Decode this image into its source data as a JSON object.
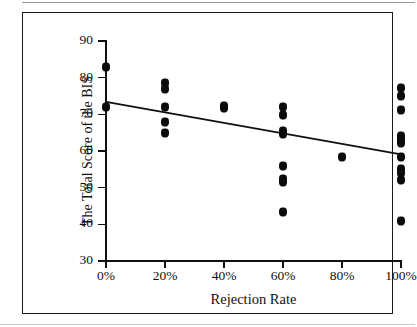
{
  "chart_data": {
    "type": "scatter",
    "title": "",
    "xlabel": "Rejection Rate",
    "ylabel": "The Total Score of the BIS",
    "xlim": [
      0,
      100
    ],
    "ylim": [
      30,
      90
    ],
    "grid": false,
    "legend": "none",
    "x_tick_labels": [
      "0%",
      "20%",
      "40%",
      "60%",
      "80%",
      "100%"
    ],
    "x_tick_values": [
      0,
      20,
      40,
      60,
      80,
      100
    ],
    "y_tick_labels": [
      "30",
      "40",
      "50",
      "60",
      "70",
      "80",
      "90"
    ],
    "y_tick_values": [
      30,
      40,
      50,
      60,
      70,
      80,
      90
    ],
    "points": [
      {
        "x": 0,
        "y": 83
      },
      {
        "x": 0,
        "y": 72
      },
      {
        "x": 20,
        "y": 78.5
      },
      {
        "x": 20,
        "y": 77
      },
      {
        "x": 20,
        "y": 72
      },
      {
        "x": 20,
        "y": 68
      },
      {
        "x": 20,
        "y": 65
      },
      {
        "x": 40,
        "y": 72.3
      },
      {
        "x": 40,
        "y": 71.6
      },
      {
        "x": 60,
        "y": 72
      },
      {
        "x": 60,
        "y": 69.7
      },
      {
        "x": 60,
        "y": 65.4
      },
      {
        "x": 60,
        "y": 64.6
      },
      {
        "x": 60,
        "y": 56
      },
      {
        "x": 60,
        "y": 52.5
      },
      {
        "x": 60,
        "y": 51.6
      },
      {
        "x": 60,
        "y": 43.5
      },
      {
        "x": 80,
        "y": 58.5
      },
      {
        "x": 100,
        "y": 77.2
      },
      {
        "x": 100,
        "y": 75
      },
      {
        "x": 100,
        "y": 71.2
      },
      {
        "x": 100,
        "y": 64.2
      },
      {
        "x": 100,
        "y": 63.2
      },
      {
        "x": 100,
        "y": 62.3
      },
      {
        "x": 100,
        "y": 58.4
      },
      {
        "x": 100,
        "y": 55
      },
      {
        "x": 100,
        "y": 54
      },
      {
        "x": 100,
        "y": 52.2
      },
      {
        "x": 100,
        "y": 41
      }
    ],
    "trendline": {
      "type": "linear",
      "x_start": 0,
      "y_start": 73.4,
      "x_end": 100,
      "y_end": 59.1
    },
    "marker": {
      "shape": "diamond",
      "color": "#0b0b0b"
    },
    "line_color": "#111111",
    "axis_color": "#111111",
    "background": "#ffffff"
  }
}
